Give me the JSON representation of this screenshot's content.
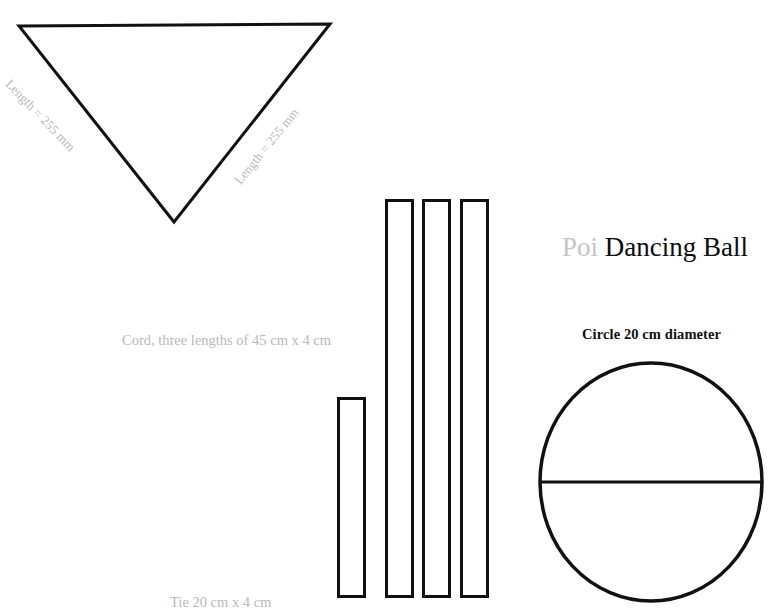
{
  "document": {
    "title": "Poi Dancing Ball",
    "title_prefix": "Poi",
    "title_main": "Dancing Ball"
  },
  "shapes": {
    "triangle": {
      "name": "fabric-triangle",
      "left_edge_label": "Length = 255 mm",
      "right_edge_label": "Length = 255 mm",
      "points": "19,26 330,24 174,222",
      "stroke": "#111111",
      "stroke_width": 3
    },
    "tie_bar": {
      "name": "tie-strip",
      "label": "Tie 20 cm x 4 cm",
      "x": 337,
      "y": 397,
      "width": 28,
      "height": 201,
      "stroke": "#111111",
      "stroke_width": 3
    },
    "cord_bars": {
      "name": "cord-strips",
      "label": "Cord, three lengths of 45 cm x 4 cm",
      "count": 3,
      "bars": [
        {
          "x": 385,
          "y": 199,
          "width": 28,
          "height": 399
        },
        {
          "x": 422,
          "y": 199,
          "width": 28,
          "height": 399
        },
        {
          "x": 460,
          "y": 199,
          "width": 28,
          "height": 399
        }
      ],
      "stroke": "#111111",
      "stroke_width": 3
    },
    "circle": {
      "name": "ball-circle",
      "label": "Circle 20 cm diameter",
      "cx": 651,
      "cy": 482,
      "rx": 111,
      "ry": 119,
      "diameter_line_y": 482,
      "stroke": "#111111",
      "stroke_width": 3.5
    }
  },
  "colors": {
    "ink": "#111111",
    "muted_text": "#b9b9b9",
    "title_prefix": "#c4c4c4",
    "title_main": "#0d0d0d",
    "background": "#ffffff"
  }
}
